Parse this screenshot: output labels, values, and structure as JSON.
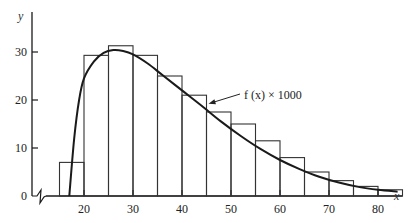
{
  "chart_data": {
    "type": "bar",
    "subtype": "histogram with fitted density curve",
    "title": "",
    "xlabel": "x",
    "ylabel": "y",
    "xlim": [
      10,
      85
    ],
    "ylim": [
      0,
      35
    ],
    "x_ticks": [
      20,
      30,
      40,
      50,
      60,
      70,
      80
    ],
    "y_ticks": [
      0,
      10,
      20,
      30
    ],
    "grid": false,
    "axis_break_on_x": true,
    "histogram": {
      "bin_width": 5,
      "bins": [
        {
          "from": 15,
          "to": 20,
          "value": 7
        },
        {
          "from": 20,
          "to": 25,
          "value": 29.3
        },
        {
          "from": 25,
          "to": 30,
          "value": 31.3
        },
        {
          "from": 30,
          "to": 35,
          "value": 29.3
        },
        {
          "from": 35,
          "to": 40,
          "value": 25
        },
        {
          "from": 40,
          "to": 45,
          "value": 21
        },
        {
          "from": 45,
          "to": 50,
          "value": 17.5
        },
        {
          "from": 50,
          "to": 55,
          "value": 15
        },
        {
          "from": 55,
          "to": 60,
          "value": 11.5
        },
        {
          "from": 60,
          "to": 65,
          "value": 8
        },
        {
          "from": 65,
          "to": 70,
          "value": 5
        },
        {
          "from": 70,
          "to": 75,
          "value": 3.2
        },
        {
          "from": 75,
          "to": 80,
          "value": 2
        },
        {
          "from": 80,
          "to": 85,
          "value": 1.3
        }
      ]
    },
    "curve": {
      "name": "f(x) × 1000",
      "points": [
        [
          17,
          0
        ],
        [
          18,
          12
        ],
        [
          19,
          20
        ],
        [
          20,
          24.5
        ],
        [
          22,
          28
        ],
        [
          24,
          29.8
        ],
        [
          26,
          30.4
        ],
        [
          28,
          30.2
        ],
        [
          30,
          29.5
        ],
        [
          33,
          27.6
        ],
        [
          36,
          25.2
        ],
        [
          40,
          22
        ],
        [
          44,
          18.8
        ],
        [
          48,
          15.5
        ],
        [
          52,
          12.5
        ],
        [
          56,
          9.8
        ],
        [
          60,
          7.5
        ],
        [
          64,
          5.6
        ],
        [
          68,
          4.0
        ],
        [
          72,
          2.8
        ],
        [
          76,
          1.9
        ],
        [
          80,
          1.3
        ],
        [
          84,
          0.9
        ]
      ]
    },
    "annotations": [
      {
        "text": "f(x) × 1000",
        "points_to_x": 45,
        "points_to_y": 19
      }
    ]
  },
  "labels": {
    "x_axis": "x",
    "y_axis": "y",
    "curve_label": "f (x) × 1000"
  }
}
